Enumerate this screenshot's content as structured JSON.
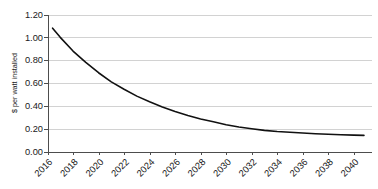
{
  "chart_data": {
    "type": "line",
    "title": "",
    "subtitle": "",
    "xlabel": "",
    "ylabel": "$ per watt installed",
    "grid": "horizontal",
    "legend": "none",
    "xlim": [
      2016,
      2041
    ],
    "ylim": [
      0.0,
      1.2
    ],
    "ytick_labels": [
      "0.00",
      "0.20",
      "0.40",
      "0.60",
      "0.80",
      "1.00",
      "1.20"
    ],
    "ytick_values": [
      0.0,
      0.2,
      0.4,
      0.6,
      0.8,
      1.0,
      1.2
    ],
    "xtick_labels": [
      "2016",
      "2018",
      "2020",
      "2022",
      "2024",
      "2026",
      "2028",
      "2030",
      "2032",
      "2034",
      "2036",
      "2038",
      "2040"
    ],
    "xtick_values": [
      2016,
      2018,
      2020,
      2022,
      2024,
      2026,
      2028,
      2030,
      2032,
      2034,
      2036,
      2038,
      2040
    ],
    "series": [
      {
        "name": "Installed cost",
        "color": "#111111",
        "x": [
          2016.4,
          2017,
          2018,
          2019,
          2020,
          2021,
          2022,
          2023,
          2024,
          2025,
          2026,
          2027,
          2028,
          2029,
          2030,
          2031,
          2032,
          2033,
          2034,
          2035,
          2036,
          2037,
          2038,
          2039,
          2040,
          2040.8
        ],
        "values": [
          1.08,
          1.0,
          0.88,
          0.78,
          0.69,
          0.61,
          0.545,
          0.485,
          0.435,
          0.39,
          0.35,
          0.315,
          0.285,
          0.26,
          0.235,
          0.215,
          0.2,
          0.185,
          0.175,
          0.168,
          0.162,
          0.156,
          0.151,
          0.147,
          0.143,
          0.141
        ]
      }
    ]
  },
  "colors": {
    "background": "#ffffff",
    "grid": "#bfbfbf",
    "axis": "#4d4d4d",
    "series": "#111111",
    "text": "#1a1a1a"
  }
}
